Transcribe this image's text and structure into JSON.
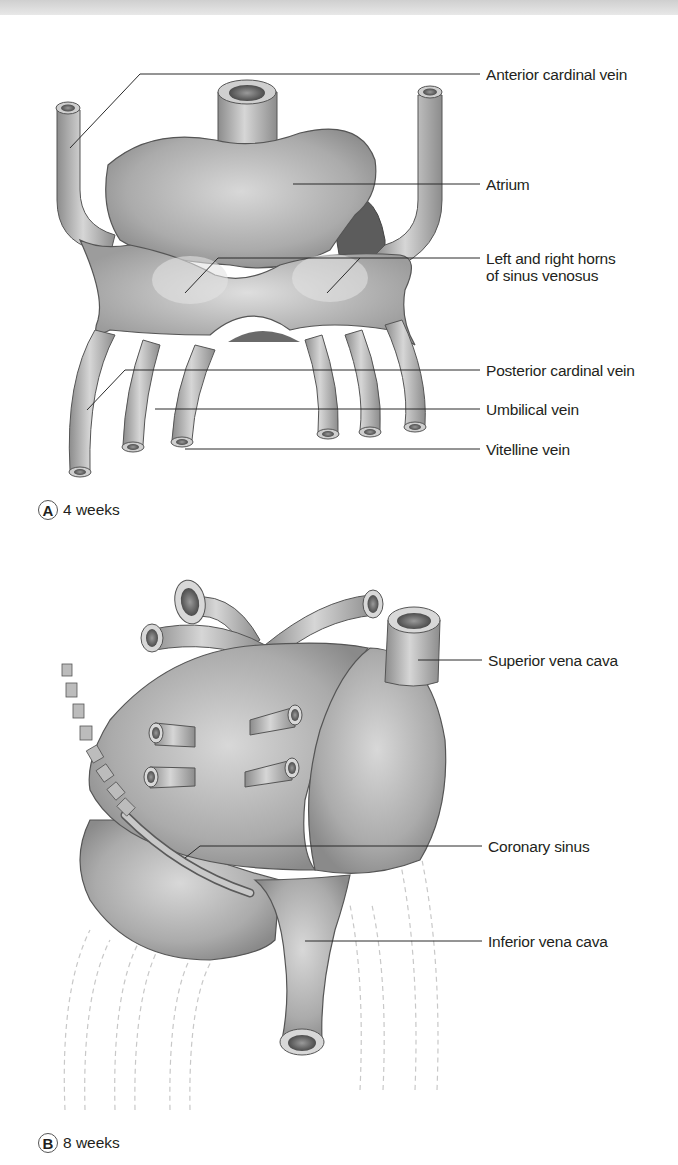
{
  "figure": {
    "panels": [
      {
        "id": "A",
        "caption": "4 weeks",
        "labels": [
          "Anterior cardinal vein",
          "Atrium",
          "Left and right horns",
          "of sinus venosus",
          "Posterior cardinal vein",
          "Umbilical vein",
          "Vitelline vein"
        ]
      },
      {
        "id": "B",
        "caption": "8 weeks",
        "labels": [
          "Superior vena cava",
          "Coronary sinus",
          "Inferior vena cava"
        ]
      }
    ],
    "colors": {
      "tissue": "#a8a8a8",
      "tissue_light": "#d4d4d4",
      "tissue_dark": "#6e6e6e",
      "outline": "#4a4a4a",
      "leader": "#2a2a2a",
      "ghost_vessel": "#cfcfcf"
    }
  }
}
